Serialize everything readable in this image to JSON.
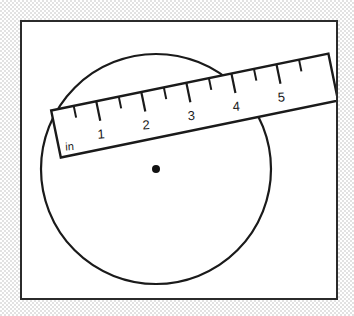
{
  "figure": {
    "background_texture": "halftone-dither-gray",
    "frame": {
      "border_color": "#2b2b2b",
      "fill_color": "#ffffff",
      "x": 20,
      "y": 20,
      "width": 318,
      "height": 280
    },
    "circle": {
      "center_x": 154,
      "center_y": 167,
      "radius": 115,
      "stroke_color": "#1a1a1a",
      "stroke_width": 2.2,
      "fill": "none"
    },
    "center_dot": {
      "x": 154,
      "y": 167,
      "radius": 4,
      "color": "#111111"
    },
    "ruler": {
      "unit_label": "in",
      "numbers": [
        "1",
        "2",
        "3",
        "4",
        "5"
      ],
      "angle_degrees": -11.5,
      "stroke_color": "#1a1a1a",
      "stroke_width": 2.4,
      "fill": "#ffffff",
      "corners": {
        "top_left_x": 48,
        "top_left_y": 110,
        "top_right_x": 329,
        "top_right_y": 48,
        "bottom_right_x": 337,
        "bottom_right_y": 96,
        "bottom_left_x": 56,
        "bottom_left_y": 158
      },
      "major_tick_count": 6,
      "minor_tick_count": 6,
      "tick_spacing_px": 46
    }
  }
}
